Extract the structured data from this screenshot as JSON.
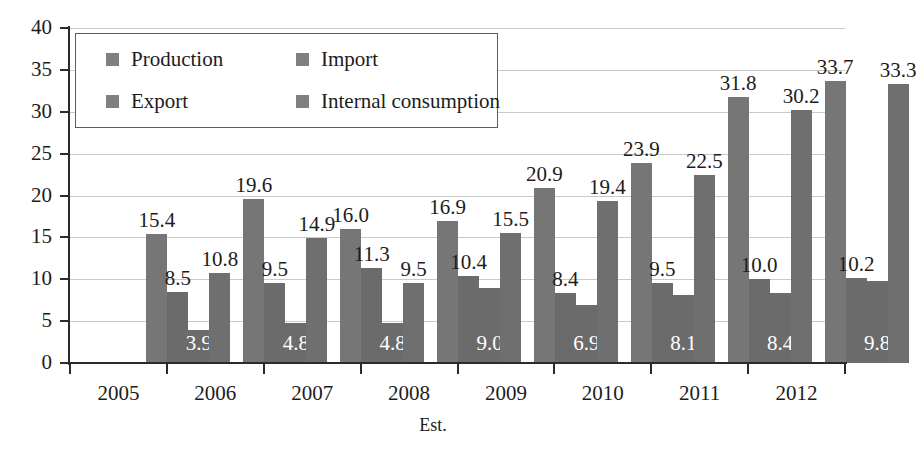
{
  "chart_data": {
    "type": "bar",
    "title": "",
    "subtitle": "",
    "xlabel": "Est.",
    "ylabel": "",
    "ylim": [
      0,
      40
    ],
    "ytick_step": 5,
    "yticks": [
      "0",
      "5",
      "10",
      "15",
      "20",
      "25",
      "30",
      "35",
      "40"
    ],
    "grid": true,
    "legend_position": "top-left-inside",
    "categories": [
      "2005",
      "2006",
      "2007",
      "2008",
      "2009",
      "2010",
      "2011",
      "2012"
    ],
    "series": [
      {
        "name": "Production",
        "color": "#767676",
        "values": [
          15.4,
          19.6,
          16.0,
          16.9,
          20.9,
          23.9,
          31.8,
          33.7
        ],
        "labels": [
          "15.4",
          "19.6",
          "16.0",
          "16.9",
          "20.9",
          "23.9",
          "31.8",
          "33.7"
        ],
        "label_style": "above"
      },
      {
        "name": "Import",
        "color": "#6b6b6b",
        "values": [
          8.5,
          9.5,
          11.3,
          10.4,
          8.4,
          9.5,
          10.0,
          10.2
        ],
        "labels": [
          "8.5",
          "9.5",
          "11.3",
          "10.4",
          "8.4",
          "9.5",
          "10.0",
          "10.2"
        ],
        "label_style": "above"
      },
      {
        "name": "Export",
        "color": "#6b6b6b",
        "values": [
          3.9,
          4.8,
          4.8,
          9.0,
          6.9,
          8.1,
          8.4,
          9.8
        ],
        "labels": [
          "3.9",
          "4.8",
          "4.8",
          "9.0",
          "6.9",
          "8.1",
          "8.4",
          "9.8"
        ],
        "label_style": "inside"
      },
      {
        "name": "Internal consumption",
        "color": "#6f6f6f",
        "values": [
          10.8,
          14.9,
          9.5,
          15.5,
          19.4,
          22.5,
          30.2,
          33.3
        ],
        "labels": [
          "10.8",
          "14.9",
          "9.5",
          "15.5",
          "19.4",
          "22.5",
          "30.2",
          "33.3"
        ],
        "label_style": "above"
      }
    ]
  },
  "legend": {
    "items": [
      {
        "label": "Production",
        "color": "#808080"
      },
      {
        "label": "Import",
        "color": "#808080"
      },
      {
        "label": "Export",
        "color": "#808080"
      },
      {
        "label": "Internal consumption",
        "color": "#808080"
      }
    ]
  },
  "axis": {
    "x_title": "Est."
  }
}
